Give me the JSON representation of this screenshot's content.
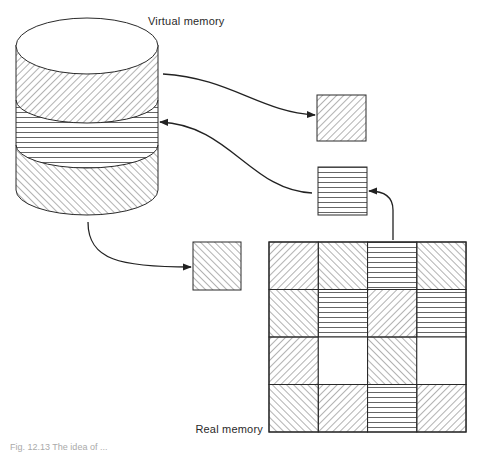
{
  "labels": {
    "virtual_memory": "Virtual memory",
    "real_memory": "Real memory",
    "caption": "Fig. 12.13  The idea of ..."
  },
  "colors": {
    "stroke": "#2a2a2a",
    "hatch": "#555555",
    "background": "#ffffff"
  },
  "pattern_legend": {
    "fwd": "forward-diagonal hatch (/)",
    "back": "back-diagonal hatch (\\)",
    "horiz": "horizontal hatch (=)",
    "empty": "free page frame"
  },
  "virtual_memory": {
    "bands": [
      "fwd",
      "horiz",
      "back"
    ]
  },
  "transit_pages": [
    {
      "id": "page-out",
      "pattern": "fwd",
      "direction": "virtual-to-real"
    },
    {
      "id": "page-in",
      "pattern": "horiz",
      "direction": "real-to-virtual"
    },
    {
      "id": "page-load",
      "pattern": "back",
      "direction": "virtual-to-real"
    }
  ],
  "real_memory": {
    "rows": 4,
    "cols": 4,
    "cells": [
      [
        "fwd",
        "back",
        "horiz",
        "back"
      ],
      [
        "back",
        "horiz",
        "fwd",
        "horiz"
      ],
      [
        "fwd",
        "empty",
        "back",
        "empty"
      ],
      [
        "back",
        "fwd",
        "horiz",
        "fwd"
      ]
    ]
  }
}
